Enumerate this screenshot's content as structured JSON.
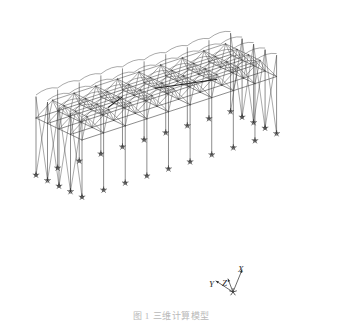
{
  "figure": {
    "type": "3d-structural-wireframe",
    "background_color": "#ffffff",
    "line_color": "#404040",
    "highlight_line_color": "#111111",
    "caption_color": "#b9b9b9"
  },
  "axes": {
    "label_x": "X",
    "label_y": "Y",
    "label_z": "Z",
    "origin": {
      "x": 233,
      "y": 292
    }
  },
  "model": {
    "description": "Double-layer grid space frame roof on columns with pinned supports",
    "bays_long": 9,
    "bays_short": 4,
    "support_symbol": "pinned-support-star",
    "support_count": 26,
    "column_count": 26
  },
  "geometry": {
    "projection": {
      "ax": 0.92,
      "ay": -0.3,
      "bx": 0.46,
      "by": 0.22,
      "cx": 0.0,
      "cy": -1.0,
      "ox": 36,
      "oy": 118,
      "scale": 1.0
    },
    "grid": {
      "nx": 9,
      "ny": 4,
      "dx": 23.5,
      "dy": 25.0,
      "top_z": 0,
      "bottom_z": 17,
      "column_z": 78,
      "arch_rise": 12
    }
  },
  "caption": {
    "text": "图 1  三维计算模型"
  }
}
